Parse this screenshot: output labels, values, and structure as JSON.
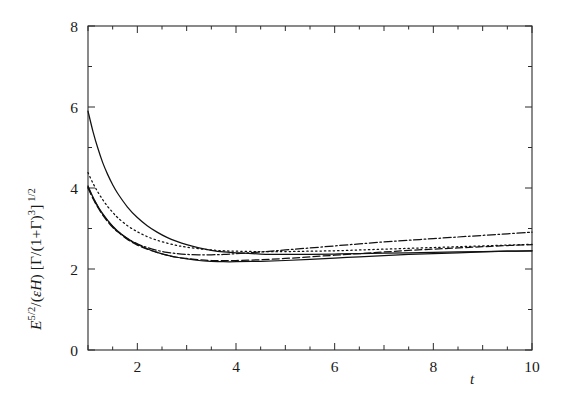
{
  "figure": {
    "background_color": "#ffffff",
    "line_color": "#111111",
    "axis_color": "#2b2b2b"
  },
  "axes": {
    "x_label_plain": "t",
    "y_label_plain": "E^5/2/(εH) [Γ/(1+Γ)^3]^1/2",
    "x_ticks": [
      "2",
      "4",
      "6",
      "8",
      "10"
    ],
    "y_ticks": [
      "0",
      "2",
      "4",
      "6",
      "8"
    ],
    "x_tick_values": [
      2,
      4,
      6,
      8,
      10
    ],
    "y_tick_values": [
      0,
      2,
      4,
      6,
      8
    ],
    "x_minor_step": 0.5,
    "y_minor_step": 1
  },
  "chart_data": {
    "type": "line",
    "title": "",
    "subtitle": "",
    "xlabel": "t",
    "ylabel": "E^5/2/(εH) [Γ/(1+Γ)^3]^1/2",
    "xlim": [
      1,
      10
    ],
    "ylim": [
      0,
      8
    ],
    "grid": false,
    "legend": null,
    "legend_position": "none",
    "annotations": [],
    "x": [
      1.0,
      1.1,
      1.2,
      1.3,
      1.4,
      1.5,
      1.6,
      1.8,
      2.0,
      2.2,
      2.4,
      2.6,
      2.8,
      3.0,
      3.25,
      3.5,
      3.75,
      4.0,
      4.5,
      5.0,
      5.5,
      6.0,
      6.5,
      7.0,
      7.5,
      8.0,
      8.5,
      9.0,
      9.5,
      10.0
    ],
    "series": [
      {
        "name": "curve-1",
        "style": "solid",
        "values": [
          5.9,
          5.4,
          4.98,
          4.62,
          4.33,
          4.08,
          3.87,
          3.53,
          3.27,
          3.07,
          2.91,
          2.78,
          2.68,
          2.6,
          2.52,
          2.46,
          2.42,
          2.4,
          2.37,
          2.36,
          2.36,
          2.37,
          2.38,
          2.39,
          2.4,
          2.41,
          2.42,
          2.43,
          2.44,
          2.45
        ]
      },
      {
        "name": "curve-2",
        "style": "solid",
        "values": [
          4.05,
          3.78,
          3.55,
          3.36,
          3.2,
          3.06,
          2.94,
          2.75,
          2.61,
          2.5,
          2.41,
          2.34,
          2.29,
          2.25,
          2.21,
          2.19,
          2.18,
          2.18,
          2.19,
          2.21,
          2.24,
          2.27,
          2.3,
          2.33,
          2.36,
          2.38,
          2.4,
          2.42,
          2.44,
          2.45
        ]
      },
      {
        "name": "curve-3",
        "style": "dashed",
        "values": [
          4.0,
          3.74,
          3.52,
          3.33,
          3.17,
          3.03,
          2.92,
          2.73,
          2.59,
          2.49,
          2.41,
          2.34,
          2.29,
          2.26,
          2.23,
          2.21,
          2.21,
          2.21,
          2.23,
          2.26,
          2.3,
          2.34,
          2.38,
          2.42,
          2.46,
          2.49,
          2.52,
          2.55,
          2.58,
          2.6
        ]
      },
      {
        "name": "curve-4",
        "style": "dash-dot",
        "values": [
          4.02,
          3.76,
          3.54,
          3.35,
          3.19,
          3.05,
          2.93,
          2.75,
          2.62,
          2.53,
          2.46,
          2.41,
          2.38,
          2.36,
          2.35,
          2.35,
          2.36,
          2.38,
          2.42,
          2.47,
          2.52,
          2.57,
          2.62,
          2.67,
          2.71,
          2.75,
          2.79,
          2.83,
          2.87,
          2.91
        ]
      },
      {
        "name": "curve-5",
        "style": "dotted",
        "values": [
          4.38,
          4.12,
          3.9,
          3.71,
          3.54,
          3.4,
          3.27,
          3.07,
          2.92,
          2.8,
          2.71,
          2.64,
          2.58,
          2.54,
          2.5,
          2.47,
          2.45,
          2.44,
          2.43,
          2.43,
          2.44,
          2.45,
          2.47,
          2.49,
          2.51,
          2.53,
          2.55,
          2.57,
          2.59,
          2.61
        ]
      }
    ]
  }
}
